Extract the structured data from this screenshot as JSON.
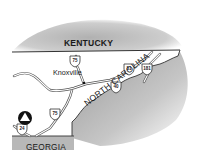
{
  "map": {
    "states": {
      "north": "KENTUCKY",
      "south": "GEORGIA",
      "southeast": "NORTH CAROLINA"
    },
    "cities": [
      {
        "name": "Knoxville"
      }
    ],
    "highways": [
      {
        "number": "75",
        "type": "interstate",
        "position": "north"
      },
      {
        "number": "81",
        "type": "interstate"
      },
      {
        "number": "181",
        "type": "interstate"
      },
      {
        "number": "40",
        "type": "interstate"
      },
      {
        "number": "75",
        "type": "interstate",
        "position": "south"
      },
      {
        "number": "24",
        "type": "interstate"
      }
    ],
    "markers": [
      {
        "icon": "triangle-in-circle-icon",
        "location": "southwest corner near I-24"
      }
    ],
    "colors": {
      "shading": "#b5b5b5",
      "borders": "#333333",
      "roads": "#555555",
      "land": "#ffffff"
    }
  }
}
